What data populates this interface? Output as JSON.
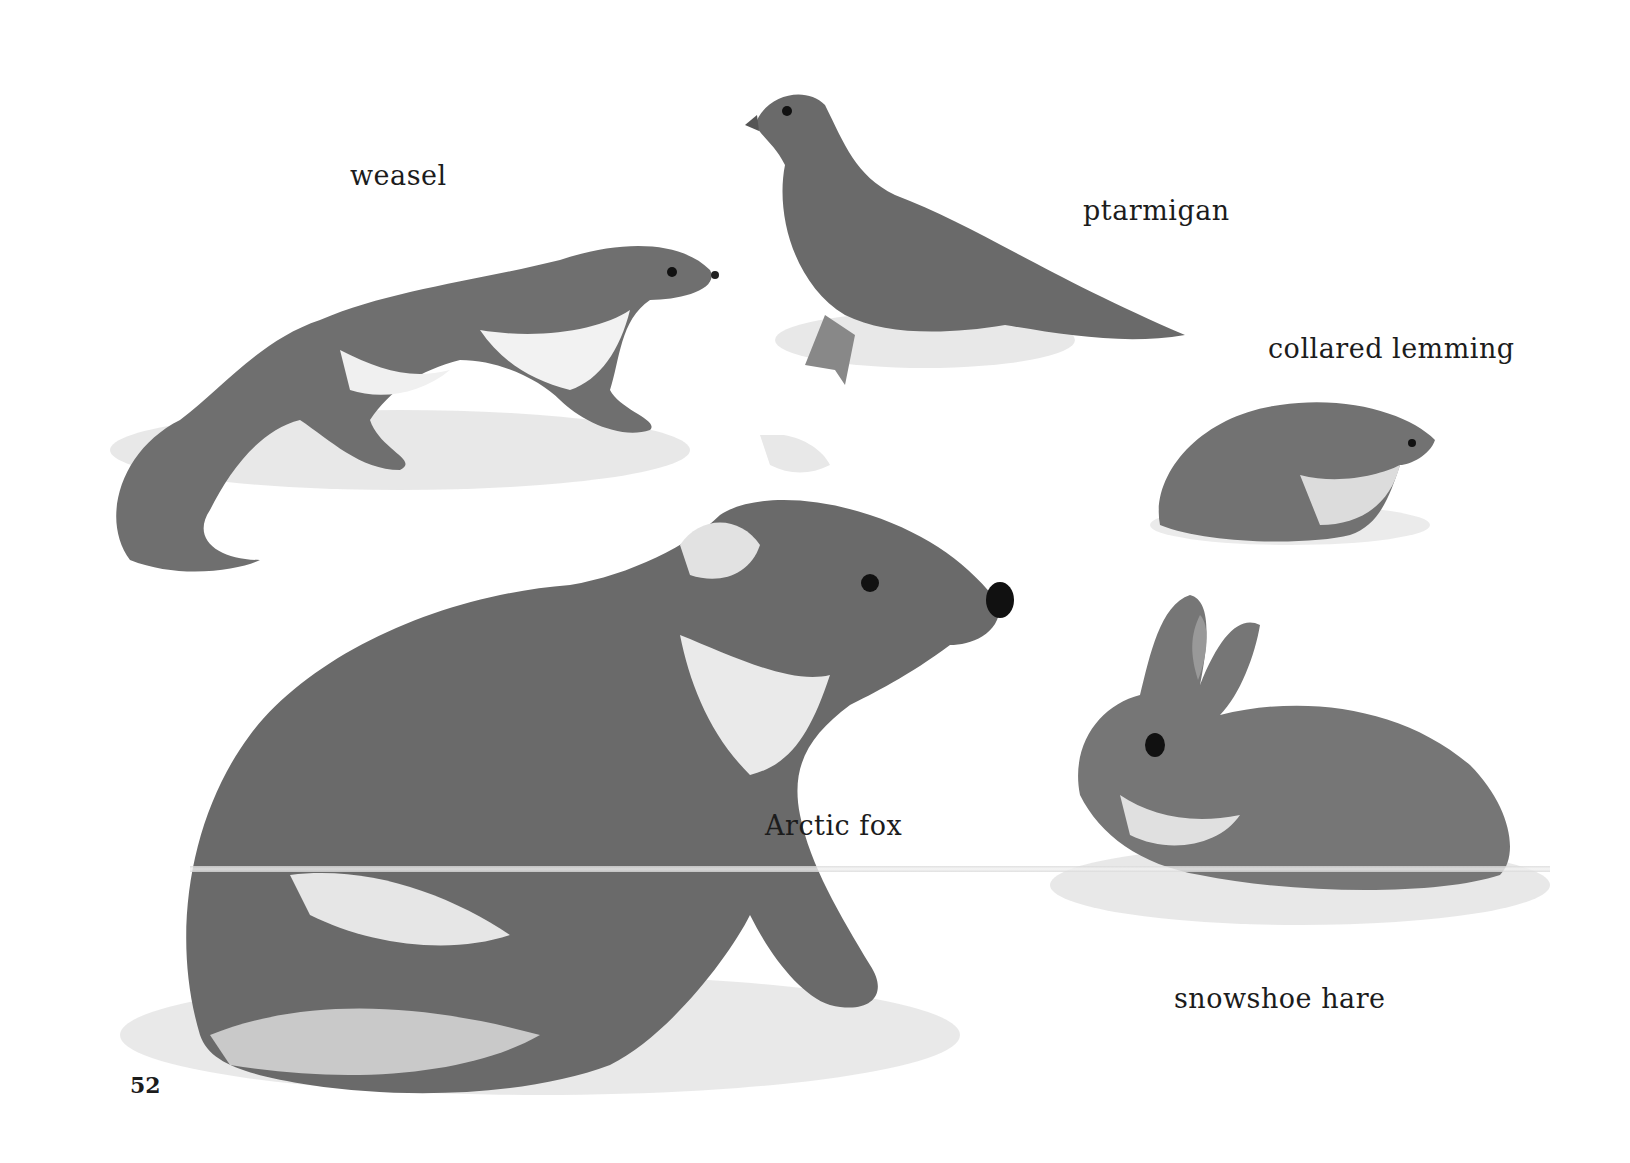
{
  "page": {
    "page_number": "52",
    "background_color": "#ffffff",
    "illustration_tone": "grayscale watercolor",
    "animals": [
      {
        "id": "weasel",
        "label": "weasel"
      },
      {
        "id": "ptarmigan",
        "label": "ptarmigan"
      },
      {
        "id": "collared-lemming",
        "label": "collared lemming"
      },
      {
        "id": "arctic-fox",
        "label": "Arctic fox"
      },
      {
        "id": "snowshoe-hare",
        "label": "snowshoe hare"
      }
    ]
  }
}
